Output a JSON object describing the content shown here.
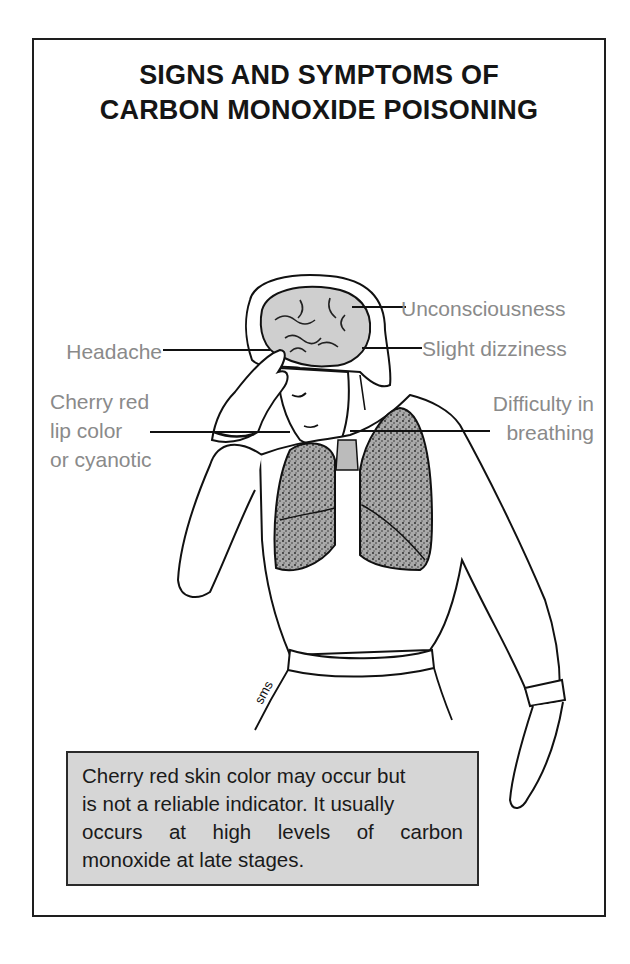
{
  "poster": {
    "title_line1": "SIGNS AND SYMPTOMS OF",
    "title_line2": "CARBON MONOXIDE POISONING",
    "accent_colors": {
      "frame": "#1e1e1e",
      "label_text": "#8a8a8a",
      "note_fill": "#d6d6d6",
      "lung_fill": "#9a9a9a",
      "brain_fill": "#cfcfcf"
    }
  },
  "labels": {
    "left": [
      {
        "id": "headache",
        "lines": [
          "Headache"
        ]
      },
      {
        "id": "lip-color",
        "lines": [
          "Cherry red",
          "lip color",
          "or cyanotic"
        ]
      }
    ],
    "right": [
      {
        "id": "unconsciousness",
        "lines": [
          "Unconsciousness"
        ]
      },
      {
        "id": "dizziness",
        "lines": [
          "Slight dizziness"
        ]
      },
      {
        "id": "breathing",
        "lines": [
          "Difficulty in",
          "breathing"
        ]
      }
    ]
  },
  "note": {
    "lines": [
      "Cherry red skin color may occur but",
      "is not a reliable indicator. It usually",
      "occurs at high levels of carbon",
      "monoxide at late stages."
    ]
  },
  "illustration": {
    "subject": "person holding head with brain and lungs shown",
    "signature": "sms"
  }
}
